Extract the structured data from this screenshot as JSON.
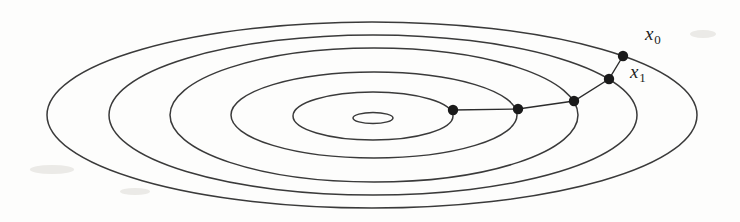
{
  "figure": {
    "background_color": "#fdfdfc",
    "line_color": "#3a3a3a",
    "point_color": "#1a1a1a",
    "width": 740,
    "height": 222
  },
  "labels": {
    "x0": {
      "base": "x",
      "sub": "0",
      "x": 645,
      "y": 24
    },
    "x1": {
      "base": "x",
      "sub": "1",
      "x": 630,
      "y": 62
    }
  },
  "chart_data": {
    "type": "line",
    "xlabel": "",
    "ylabel": "",
    "grid": false,
    "legend": null,
    "annotations": [
      "x0",
      "x1"
    ],
    "center": [
      373,
      116
    ],
    "contours": [
      {
        "name": "contour-1-innermost",
        "cx": 373,
        "cy": 118,
        "rx": 20,
        "ry": 5.5
      },
      {
        "name": "contour-2",
        "cx": 373,
        "cy": 116,
        "rx": 80,
        "ry": 24
      },
      {
        "name": "contour-3",
        "cx": 374,
        "cy": 115,
        "rx": 143,
        "ry": 43
      },
      {
        "name": "contour-4",
        "cx": 374,
        "cy": 115,
        "rx": 204,
        "ry": 67
      },
      {
        "name": "contour-5",
        "cx": 373,
        "cy": 115,
        "rx": 264,
        "ry": 80
      },
      {
        "name": "contour-6-outermost",
        "cx": 372,
        "cy": 115,
        "rx": 325,
        "ry": 93
      }
    ],
    "path_points": [
      {
        "label": "x0",
        "x": 623,
        "y": 56
      },
      {
        "label": "x1",
        "x": 609,
        "y": 79
      },
      {
        "label": "x2",
        "x": 574,
        "y": 101
      },
      {
        "label": "x3",
        "x": 518,
        "y": 109
      },
      {
        "label": "x4",
        "x": 453,
        "y": 110
      }
    ],
    "path_polyline": "623,56 609,79 574,101 518,109 453,110"
  }
}
